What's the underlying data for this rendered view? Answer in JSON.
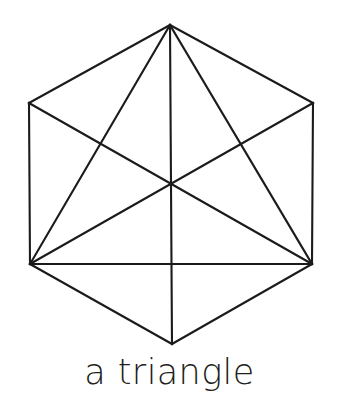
{
  "figure": {
    "title": "a triangle",
    "caption": "a triangle",
    "canvas": {
      "width": 339,
      "height": 396
    },
    "stroke_color": "#1b1b1b",
    "text_color": "#231f20",
    "background_color": "#ffffff",
    "stroke_width": 2.1,
    "center_point": {
      "x": 171,
      "y": 184
    },
    "vertices": {
      "top": {
        "x": 170,
        "y": 25
      },
      "top_left": {
        "x": 29,
        "y": 103
      },
      "top_right": {
        "x": 313,
        "y": 103
      },
      "bottom_left": {
        "x": 30,
        "y": 264
      },
      "bottom_right": {
        "x": 312,
        "y": 264
      },
      "bottom": {
        "x": 172,
        "y": 344
      }
    },
    "hexagon_outline": "170,25 313,103 312,264 172,344 30,264 29,103",
    "inscribed_triangle": "170,25 30,264 312,264",
    "lines": [
      {
        "name": "hex-edge-top-right",
        "x1": 170,
        "y1": 25,
        "x2": 313,
        "y2": 103
      },
      {
        "name": "hex-edge-right",
        "x1": 313,
        "y1": 103,
        "x2": 312,
        "y2": 264
      },
      {
        "name": "hex-edge-bottom-right",
        "x1": 312,
        "y1": 264,
        "x2": 172,
        "y2": 344
      },
      {
        "name": "hex-edge-bottom-left",
        "x1": 172,
        "y1": 344,
        "x2": 30,
        "y2": 264
      },
      {
        "name": "hex-edge-left",
        "x1": 30,
        "y1": 264,
        "x2": 29,
        "y2": 103
      },
      {
        "name": "hex-edge-top-left",
        "x1": 29,
        "y1": 103,
        "x2": 170,
        "y2": 25
      },
      {
        "name": "triangle-side-left",
        "x1": 170,
        "y1": 25,
        "x2": 30,
        "y2": 264
      },
      {
        "name": "triangle-side-right",
        "x1": 170,
        "y1": 25,
        "x2": 312,
        "y2": 264
      },
      {
        "name": "triangle-base",
        "x1": 30,
        "y1": 264,
        "x2": 312,
        "y2": 264
      },
      {
        "name": "diagonal-tl-br",
        "x1": 29,
        "y1": 103,
        "x2": 312,
        "y2": 264
      },
      {
        "name": "diagonal-tr-bl",
        "x1": 313,
        "y1": 103,
        "x2": 30,
        "y2": 264
      },
      {
        "name": "vertical-axis",
        "x1": 170,
        "y1": 25,
        "x2": 172,
        "y2": 344
      }
    ]
  }
}
